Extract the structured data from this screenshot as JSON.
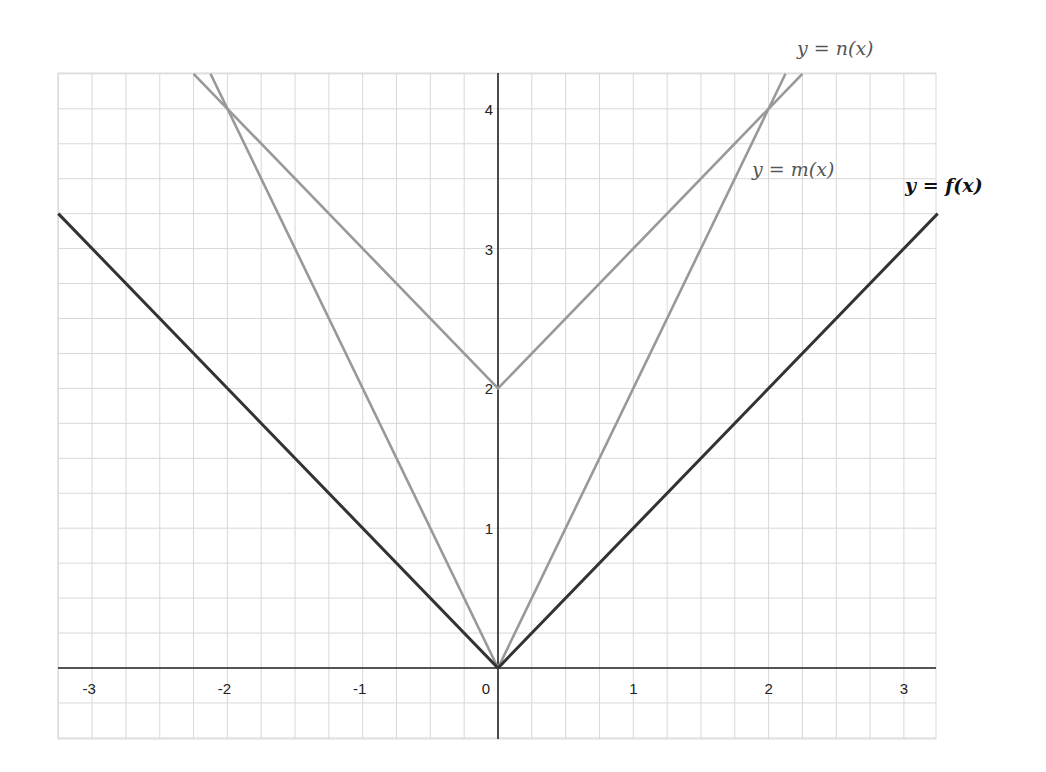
{
  "chart_data": {
    "type": "line",
    "title": "",
    "xlabel": "",
    "ylabel": "",
    "xlim": [
      -3.25,
      3.25
    ],
    "ylim": [
      -0.5,
      4.25
    ],
    "grid": true,
    "grid_minor_step": 0.25,
    "x_ticks": [
      -3,
      -2,
      -1,
      0,
      1,
      2,
      3
    ],
    "x_tick_labels": [
      "-3",
      "-2",
      "-1",
      "0",
      "1",
      "2",
      "3"
    ],
    "y_ticks": [
      1,
      2,
      3,
      4
    ],
    "y_tick_labels": [
      "1",
      "2",
      "3",
      "4"
    ],
    "series": [
      {
        "name": "y = f(x)",
        "formula": "|x|",
        "color": "#333333",
        "x": [
          -3.25,
          0,
          3.25
        ],
        "y": [
          3.25,
          0,
          3.25
        ]
      },
      {
        "name": "y = m(x)",
        "formula": "2|x|",
        "color": "#999999",
        "x": [
          -2.125,
          0,
          2.125
        ],
        "y": [
          4.25,
          0,
          4.25
        ]
      },
      {
        "name": "y = n(x)",
        "formula": "|x| + 2",
        "color": "#999999",
        "x": [
          -2.25,
          0,
          2.25
        ],
        "y": [
          4.25,
          2,
          4.25
        ]
      }
    ],
    "annotations": [
      {
        "text": "y = n(x)",
        "x": 2.25,
        "y": 4.6
      },
      {
        "text": "y = m(x)",
        "x": 1.9,
        "y": 3.5
      },
      {
        "text": "y = f(x)",
        "x": 3.05,
        "y": 3.4
      }
    ],
    "legend": "inline labels near curve ends"
  },
  "labels": {
    "n_label": "y = n(x)",
    "m_label": "y = m(x)",
    "f_label": "y = f(x)"
  },
  "x_axis": {
    "ticks": [
      {
        "value": -3,
        "label": "-3"
      },
      {
        "value": -2,
        "label": "-2"
      },
      {
        "value": -1,
        "label": "-1"
      },
      {
        "value": 0,
        "label": "0"
      },
      {
        "value": 1,
        "label": "1"
      },
      {
        "value": 2,
        "label": "2"
      },
      {
        "value": 3,
        "label": "3"
      }
    ]
  },
  "y_axis": {
    "ticks": [
      {
        "value": 1,
        "label": "1"
      },
      {
        "value": 2,
        "label": "2"
      },
      {
        "value": 3,
        "label": "3"
      },
      {
        "value": 4,
        "label": "4"
      }
    ]
  }
}
